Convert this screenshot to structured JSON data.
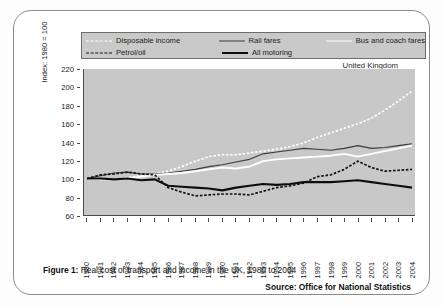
{
  "figure": {
    "caption_label": "Figure 1:",
    "caption_text": " Real cost of transport and income in the UK, 1980 to 2004",
    "source": "Source: Office for National Statistics",
    "region_label": "United Kingdom"
  },
  "legend": {
    "items": [
      {
        "label": "Disposable income",
        "style": "white-dotted"
      },
      {
        "label": "Rail fares",
        "style": "thin-dark"
      },
      {
        "label": "Bus and coach fares",
        "style": "white-solid"
      },
      {
        "label": "Petrol/oil",
        "style": "black-dashed"
      },
      {
        "label": "All motoring",
        "style": "thick-black"
      }
    ]
  },
  "chart_data": {
    "type": "line",
    "title": "Real cost of transport and income in the UK, 1980 to 2004",
    "xlabel": "",
    "ylabel": "Index: 1980 = 100",
    "ylim": [
      60,
      220
    ],
    "ytick_step": 20,
    "yticks": [
      60,
      80,
      100,
      120,
      140,
      160,
      180,
      200,
      220
    ],
    "grid": false,
    "legend_position": "top",
    "x": [
      1980,
      1981,
      1982,
      1983,
      1984,
      1985,
      1986,
      1987,
      1988,
      1989,
      1990,
      1991,
      1992,
      1993,
      1994,
      1995,
      1996,
      1997,
      1998,
      1999,
      2000,
      2001,
      2002,
      2003,
      2004
    ],
    "categories": [
      "1980",
      "1981",
      "1982",
      "1983",
      "1984",
      "1985",
      "1986",
      "1987",
      "1988",
      "1989",
      "1990",
      "1991",
      "1992",
      "1993",
      "1994",
      "1995",
      "1996",
      "1997",
      "1998",
      "1999",
      "2000",
      "2001",
      "2002",
      "2003",
      "2004"
    ],
    "series": [
      {
        "name": "Disposable income",
        "color": "#ffffff",
        "line": "dotted",
        "values": [
          100,
          99,
          99,
          101,
          103,
          105,
          108,
          113,
          119,
          124,
          126,
          126,
          128,
          130,
          132,
          135,
          139,
          145,
          150,
          155,
          160,
          166,
          175,
          185,
          196
        ]
      },
      {
        "name": "Rail fares",
        "color": "#3a3a3a",
        "line": "thin",
        "values": [
          100,
          103,
          106,
          107,
          105,
          105,
          106,
          108,
          110,
          113,
          115,
          118,
          121,
          127,
          129,
          131,
          133,
          132,
          131,
          133,
          136,
          133,
          134,
          136,
          138
        ]
      },
      {
        "name": "Bus and coach fares",
        "color": "#ffffff",
        "line": "solid",
        "values": [
          100,
          99,
          99,
          100,
          102,
          104,
          105,
          106,
          108,
          110,
          112,
          111,
          113,
          119,
          121,
          122,
          123,
          124,
          125,
          127,
          124,
          127,
          130,
          133,
          136
        ]
      },
      {
        "name": "Petrol/oil",
        "color": "#111111",
        "line": "dashed",
        "values": [
          100,
          104,
          105,
          107,
          105,
          104,
          90,
          85,
          81,
          82,
          83,
          83,
          82,
          86,
          90,
          92,
          95,
          102,
          104,
          110,
          119,
          112,
          108,
          109,
          110
        ]
      },
      {
        "name": "All motoring",
        "color": "#0d0d0d",
        "line": "thick",
        "values": [
          100,
          100,
          99,
          100,
          98,
          99,
          92,
          91,
          90,
          89,
          87,
          90,
          92,
          94,
          93,
          94,
          96,
          96,
          96,
          97,
          98,
          96,
          94,
          92,
          90
        ]
      }
    ]
  }
}
